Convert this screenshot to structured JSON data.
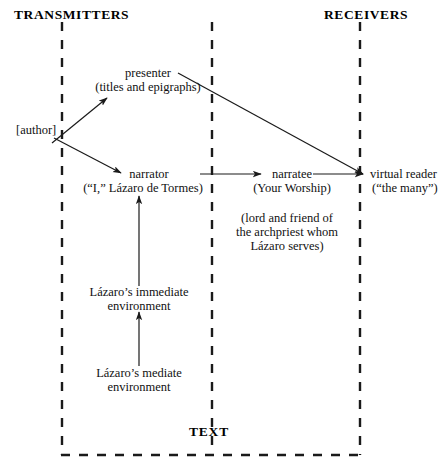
{
  "diagram": {
    "title_left": "TRANSMITTERS",
    "title_right": "RECEIVERS",
    "frame_label": "TEXT",
    "colors": {
      "ink": "#111111",
      "background": "#ffffff",
      "line": "#1a1a1a"
    },
    "nodes": {
      "author": "[author]",
      "presenter_line1": "presenter",
      "presenter_line2": "(titles and epigraphs)",
      "narrator_line1": "narrator",
      "narrator_line2": "(“I,” Lázaro de Tormes)",
      "narratee_line1": "narratee",
      "narratee_line2": "(Your Worship)",
      "narratee_note_line1": "(lord and friend of",
      "narratee_note_line2": "the archpriest whom",
      "narratee_note_line3": "Lázaro serves)",
      "virtual_reader_line1": "virtual reader",
      "virtual_reader_line2": "(“the many”)",
      "immediate_env_line1": "Lázaro’s immediate",
      "immediate_env_line2": "environment",
      "mediate_env_line1": "Lázaro’s mediate",
      "mediate_env_line2": "environment"
    },
    "edges": [
      {
        "name": "author-to-presenter",
        "from": "author",
        "to": "presenter",
        "style": "arrow"
      },
      {
        "name": "author-to-narrator",
        "from": "author",
        "to": "narrator",
        "style": "arrow"
      },
      {
        "name": "presenter-to-virtual-reader",
        "from": "presenter",
        "to": "virtual reader",
        "style": "arrow"
      },
      {
        "name": "narrator-to-narratee",
        "from": "narrator",
        "to": "narratee",
        "style": "arrow"
      },
      {
        "name": "narratee-to-virtual-reader",
        "from": "narratee",
        "to": "virtual reader",
        "style": "arrow"
      },
      {
        "name": "immediate-env-to-narrator",
        "from": "Lázaro’s immediate environment",
        "to": "narrator",
        "style": "arrow"
      },
      {
        "name": "mediate-env-to-immediate-env",
        "from": "Lázaro’s mediate environment",
        "to": "Lázaro’s immediate environment",
        "style": "arrow"
      }
    ],
    "boundaries": [
      {
        "name": "text-left-boundary",
        "orientation": "vertical",
        "x": 62
      },
      {
        "name": "text-middle-boundary",
        "orientation": "vertical",
        "x": 212
      },
      {
        "name": "text-right-boundary",
        "orientation": "vertical",
        "x": 360
      },
      {
        "name": "text-bottom-boundary",
        "orientation": "horizontal",
        "y": 455
      }
    ]
  }
}
